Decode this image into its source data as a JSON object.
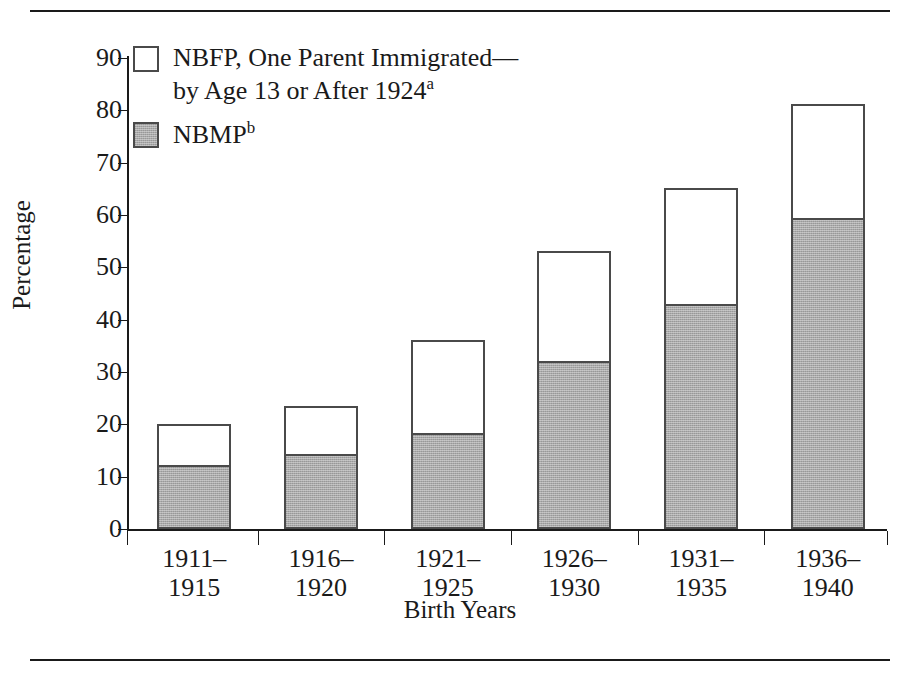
{
  "chart_data": {
    "type": "bar",
    "stacked": true,
    "title": "",
    "xlabel": "Birth Years",
    "ylabel": "Percentage",
    "ylim": [
      0,
      90
    ],
    "yticks": [
      0,
      10,
      20,
      30,
      40,
      50,
      60,
      70,
      80,
      90
    ],
    "grid": false,
    "legend_position": "top-left",
    "categories": [
      "1911–\n1915",
      "1916–\n1920",
      "1921–\n1925",
      "1926–\n1930",
      "1931–\n1935",
      "1936–\n1940"
    ],
    "series": [
      {
        "name": "NBMP",
        "name_sup": "b",
        "swatch": "filled",
        "color": "#a9a9a9",
        "values": [
          12.2,
          14.3,
          18.3,
          32.2,
          43.0,
          59.5
        ]
      },
      {
        "name": "NBFP, One Parent Immigrated—\nby Age 13 or After 1924",
        "name_sup": "a",
        "swatch": "open",
        "color": "#ffffff",
        "values": [
          7.9,
          9.2,
          17.9,
          20.9,
          22.1,
          21.7
        ]
      }
    ],
    "totals": [
      20.1,
      23.5,
      36.2,
      53.1,
      65.1,
      81.2
    ]
  },
  "axes": {
    "y_title": "Percentage",
    "x_title": "Birth Years",
    "y_tick_labels": [
      "0",
      "10",
      "20",
      "30",
      "40",
      "50",
      "60",
      "70",
      "80",
      "90"
    ],
    "x_tick_labels": [
      "1911–\n1915",
      "1916–\n1920",
      "1921–\n1925",
      "1926–\n1930",
      "1931–\n1935",
      "1936–\n1940"
    ]
  },
  "legend": {
    "items": [
      {
        "label": "NBFP, One Parent Immigrated—\nby Age 13 or After 1924",
        "superscript": "a",
        "swatch": "open"
      },
      {
        "label": "NBMP",
        "superscript": "b",
        "swatch": "filled"
      }
    ]
  },
  "colors": {
    "bar_fill_gray": "#a9a9a9",
    "bar_fill_white": "#ffffff",
    "bar_border": "#4a4a4a",
    "axis": "#1a1a1a",
    "text": "#1a1a1a",
    "background": "#ffffff"
  }
}
